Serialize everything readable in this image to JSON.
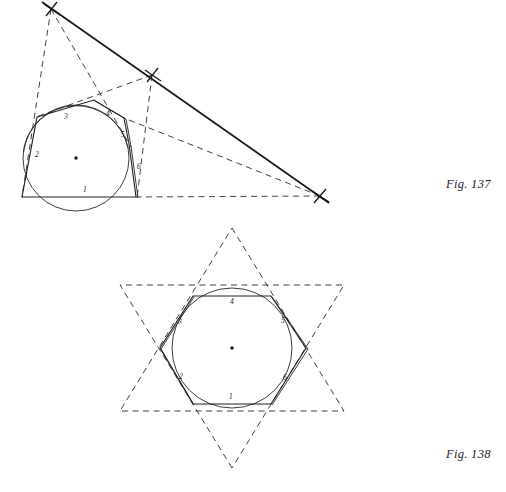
{
  "page": {
    "background": "#ffffff",
    "ink": "#262220",
    "ink_light": "#4a4542",
    "width": 506,
    "height": 492
  },
  "figures": [
    {
      "id": "fig-137",
      "caption": "Fig. 137",
      "caption_pos": {
        "x": 446,
        "y": 177
      },
      "description": "Hexagon inscribed in a circle with Pascal line construction converging to an external point",
      "circle": {
        "cx": 76,
        "cy": 158,
        "r": 53
      },
      "center_dot": {
        "x": 76,
        "y": 158,
        "r": 1.6
      },
      "vertices": [
        {
          "name": "A",
          "x": 37,
          "y": 117
        },
        {
          "name": "B",
          "x": 94,
          "y": 100
        },
        {
          "name": "C",
          "x": 124,
          "y": 118
        },
        {
          "name": "D",
          "x": 129,
          "y": 144
        },
        {
          "name": "E",
          "x": 136,
          "y": 197
        },
        {
          "name": "F",
          "x": 22,
          "y": 197
        }
      ],
      "side_labels": [
        {
          "text": "1",
          "x": 83,
          "y": 192
        },
        {
          "text": "2",
          "x": 35,
          "y": 157
        },
        {
          "text": "3",
          "x": 64,
          "y": 117
        },
        {
          "text": "4",
          "x": 106,
          "y": 115
        },
        {
          "text": "5",
          "x": 122,
          "y": 136
        },
        {
          "text": "6",
          "x": 137,
          "y": 168
        }
      ],
      "construction_points": [
        {
          "name": "P-upper-left",
          "x": 51,
          "y": 9,
          "marker": "cross"
        },
        {
          "name": "P-middle",
          "x": 152,
          "y": 75,
          "marker": "cross"
        },
        {
          "name": "P-right",
          "x": 320,
          "y": 196,
          "marker": "cross"
        }
      ],
      "solid_pascal_line": {
        "x1": 42,
        "y1": 2,
        "x2": 329,
        "y2": 203
      },
      "dashed_rays": [
        {
          "from": "P-upper-left",
          "to": "F"
        },
        {
          "from": "P-upper-left",
          "to": "D"
        },
        {
          "from": "P-middle",
          "to": "A"
        },
        {
          "from": "P-middle",
          "to": "E"
        },
        {
          "from": "P-right",
          "to": "C"
        },
        {
          "from": "P-right",
          "to": "F"
        }
      ]
    },
    {
      "id": "fig-138",
      "caption": "Fig. 138",
      "caption_pos": {
        "x": 446,
        "y": 447
      },
      "description": "Regular hexagon inscribed in a circle with extended sides forming a hexagram star",
      "circle": {
        "cx": 232,
        "cy": 348,
        "r": 60
      },
      "center_dot": {
        "x": 232,
        "y": 348,
        "r": 1.6
      },
      "vertices": [
        {
          "name": "A",
          "x": 193,
          "y": 296
        },
        {
          "name": "B",
          "x": 271,
          "y": 296
        },
        {
          "name": "C",
          "x": 306,
          "y": 348
        },
        {
          "name": "D",
          "x": 271,
          "y": 404
        },
        {
          "name": "E",
          "x": 193,
          "y": 404
        },
        {
          "name": "F",
          "x": 160,
          "y": 348
        }
      ],
      "side_labels": [
        {
          "text": "1",
          "x": 230,
          "y": 398
        },
        {
          "text": "2",
          "x": 180,
          "y": 377
        },
        {
          "text": "3",
          "x": 179,
          "y": 322
        },
        {
          "text": "4",
          "x": 231,
          "y": 301
        },
        {
          "text": "5",
          "x": 281,
          "y": 321
        },
        {
          "text": "6",
          "x": 283,
          "y": 378
        }
      ],
      "star_tips": [
        {
          "name": "tip-top",
          "x": 232,
          "y": 228
        },
        {
          "name": "tip-upper-right",
          "x": 336,
          "y": 288
        },
        {
          "name": "tip-lower-right",
          "x": 336,
          "y": 408
        },
        {
          "name": "tip-bottom",
          "x": 232,
          "y": 468
        },
        {
          "name": "tip-lower-left",
          "x": 128,
          "y": 408
        },
        {
          "name": "tip-upper-left",
          "x": 128,
          "y": 288
        }
      ]
    }
  ]
}
